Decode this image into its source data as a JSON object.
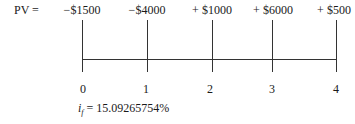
{
  "diagram": {
    "type": "cash-flow-timeline",
    "pv_label": "PV =",
    "cash_flows": [
      {
        "period": "0",
        "amount": "−$1500"
      },
      {
        "period": "1",
        "amount": "−$4000"
      },
      {
        "period": "2",
        "amount": "+ $1000"
      },
      {
        "period": "3",
        "amount": "+ $6000"
      },
      {
        "period": "4",
        "amount": "+ $500"
      }
    ],
    "rate": {
      "symbol": "i",
      "subscript": "f",
      "equals": "=",
      "value": "15.09265754%"
    }
  }
}
